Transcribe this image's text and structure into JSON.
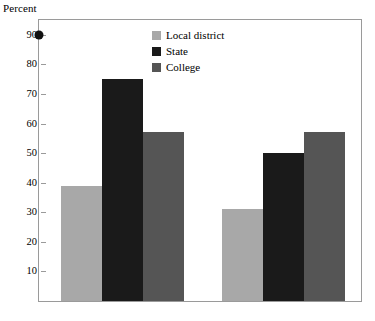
{
  "chart_data": {
    "type": "bar",
    "title": "",
    "xlabel": "",
    "ylabel": "Percent",
    "ylim": [
      0,
      95
    ],
    "ytick_values": [
      90,
      80,
      70,
      60,
      50,
      40,
      30,
      20,
      10
    ],
    "ytick_labels": [
      "90",
      "80",
      "70",
      "60",
      "50",
      "40",
      "30",
      "20",
      "10"
    ],
    "grid": false,
    "legend_position": "top-center",
    "categories": [
      "Group 1",
      "Group 2"
    ],
    "series": [
      {
        "name": "Local district",
        "color": "#a8a8a8",
        "values": [
          39,
          31
        ]
      },
      {
        "name": "State",
        "color": "#1a1a1a",
        "values": [
          75,
          50
        ]
      },
      {
        "name": "College",
        "color": "#555555",
        "values": [
          57,
          57
        ]
      }
    ],
    "annotations": [
      {
        "name": "axis-dot-marker",
        "value": 90,
        "color": "#111111",
        "shape": "circle"
      }
    ]
  },
  "legend": {
    "items": [
      {
        "label": "Local district",
        "color": "#a8a8a8"
      },
      {
        "label": "State",
        "color": "#1a1a1a"
      },
      {
        "label": "College",
        "color": "#555555"
      }
    ]
  },
  "axis": {
    "y_title": "Percent"
  },
  "colors": {
    "local_district": "#a8a8a8",
    "state": "#1a1a1a",
    "college": "#555555",
    "frame": "#9a9a9a",
    "marker": "#111111",
    "background": "#ffffff"
  }
}
